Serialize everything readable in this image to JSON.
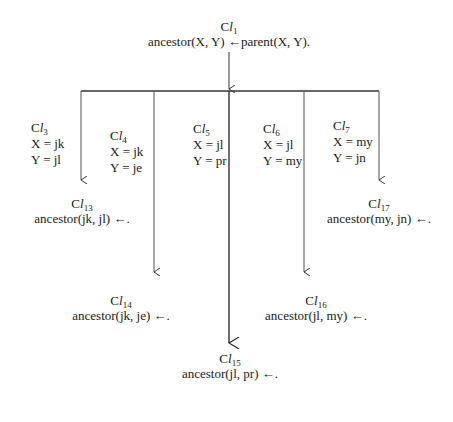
{
  "root": {
    "label_prefix": "C",
    "label_italic": "l",
    "label_sub": "1",
    "clause": "ancestor(X, Y) ←parent(X, Y)."
  },
  "branches": [
    {
      "label_prefix": "C",
      "label_italic": "l",
      "label_sub": "3",
      "x_binding": "X = jk",
      "y_binding": "Y = jl",
      "result": {
        "label_prefix": "C",
        "label_italic": "l",
        "label_sub": "13",
        "clause": "ancestor(jk, jl) ←."
      }
    },
    {
      "label_prefix": "C",
      "label_italic": "l",
      "label_sub": "4",
      "x_binding": "X = jk",
      "y_binding": "Y = je",
      "result": {
        "label_prefix": "C",
        "label_italic": "l",
        "label_sub": "14",
        "clause": "ancestor(jk, je) ←."
      }
    },
    {
      "label_prefix": "C",
      "label_italic": "l",
      "label_sub": "5",
      "x_binding": "X = jl",
      "y_binding": "Y = pr",
      "result": {
        "label_prefix": "C",
        "label_italic": "l",
        "label_sub": "15",
        "clause": "ancestor(jl, pr) ←."
      }
    },
    {
      "label_prefix": "C",
      "label_italic": "l",
      "label_sub": "6",
      "x_binding": "X = jl",
      "y_binding": "Y = my",
      "result": {
        "label_prefix": "C",
        "label_italic": "l",
        "label_sub": "16",
        "clause": "ancestor(jl, my) ←."
      }
    },
    {
      "label_prefix": "C",
      "label_italic": "l",
      "label_sub": "7",
      "x_binding": "X = my",
      "y_binding": "Y = jn",
      "result": {
        "label_prefix": "C",
        "label_italic": "l",
        "label_sub": "17",
        "clause": "ancestor(my, jn) ←."
      }
    }
  ]
}
